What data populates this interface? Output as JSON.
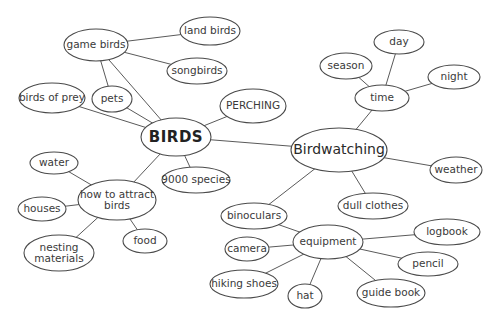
{
  "diagram": {
    "type": "mind-map",
    "nodes": [
      {
        "id": "birds",
        "label": "BIRDS",
        "x": 176,
        "y": 137,
        "rx": 35,
        "ry": 19,
        "style": "central"
      },
      {
        "id": "birdwatching",
        "label": "Birdwatching",
        "x": 339,
        "y": 150,
        "rx": 48,
        "ry": 22,
        "style": "hub"
      },
      {
        "id": "game_birds",
        "label": "game birds",
        "x": 96,
        "y": 45,
        "rx": 32,
        "ry": 16
      },
      {
        "id": "land_birds",
        "label": "land birds",
        "x": 210,
        "y": 31,
        "rx": 30,
        "ry": 14
      },
      {
        "id": "songbirds",
        "label": "songbirds",
        "x": 197,
        "y": 71,
        "rx": 30,
        "ry": 13
      },
      {
        "id": "birds_of_prey",
        "label": "birds of prey",
        "x": 52,
        "y": 98,
        "rx": 33,
        "ry": 15
      },
      {
        "id": "pets",
        "label": "pets",
        "x": 112,
        "y": 99,
        "rx": 20,
        "ry": 13
      },
      {
        "id": "perching",
        "label": "PERCHING",
        "x": 253,
        "y": 106,
        "rx": 33,
        "ry": 17
      },
      {
        "id": "species",
        "label": "9000 species",
        "x": 196,
        "y": 180,
        "rx": 34,
        "ry": 13
      },
      {
        "id": "how_to_attract",
        "label": "how to attract|birds",
        "x": 117,
        "y": 200,
        "rx": 39,
        "ry": 20
      },
      {
        "id": "water",
        "label": "water",
        "x": 54,
        "y": 163,
        "rx": 24,
        "ry": 11
      },
      {
        "id": "houses",
        "label": "houses",
        "x": 42,
        "y": 209,
        "rx": 24,
        "ry": 12
      },
      {
        "id": "nesting",
        "label": "nesting|materials",
        "x": 59,
        "y": 253,
        "rx": 35,
        "ry": 18
      },
      {
        "id": "food",
        "label": "food",
        "x": 145,
        "y": 241,
        "rx": 22,
        "ry": 12
      },
      {
        "id": "time",
        "label": "time",
        "x": 382,
        "y": 98,
        "rx": 27,
        "ry": 13
      },
      {
        "id": "day",
        "label": "day",
        "x": 399,
        "y": 42,
        "rx": 25,
        "ry": 12
      },
      {
        "id": "season",
        "label": "season",
        "x": 346,
        "y": 66,
        "rx": 26,
        "ry": 13
      },
      {
        "id": "night",
        "label": "night",
        "x": 454,
        "y": 77,
        "rx": 26,
        "ry": 12
      },
      {
        "id": "weather",
        "label": "weather",
        "x": 456,
        "y": 170,
        "rx": 26,
        "ry": 13
      },
      {
        "id": "dull_clothes",
        "label": "dull clothes",
        "x": 373,
        "y": 206,
        "rx": 35,
        "ry": 13
      },
      {
        "id": "equipment",
        "label": "equipment",
        "x": 328,
        "y": 242,
        "rx": 35,
        "ry": 17
      },
      {
        "id": "binoculars",
        "label": "binoculars",
        "x": 254,
        "y": 216,
        "rx": 33,
        "ry": 13
      },
      {
        "id": "camera",
        "label": "camera",
        "x": 247,
        "y": 249,
        "rx": 22,
        "ry": 12
      },
      {
        "id": "hiking_shoes",
        "label": "hiking shoes",
        "x": 244,
        "y": 284,
        "rx": 34,
        "ry": 14
      },
      {
        "id": "hat",
        "label": "hat",
        "x": 305,
        "y": 296,
        "rx": 17,
        "ry": 12
      },
      {
        "id": "guide_book",
        "label": "guide book",
        "x": 391,
        "y": 293,
        "rx": 34,
        "ry": 14
      },
      {
        "id": "pencil",
        "label": "pencil",
        "x": 428,
        "y": 264,
        "rx": 30,
        "ry": 12
      },
      {
        "id": "logbook",
        "label": "logbook",
        "x": 447,
        "y": 232,
        "rx": 33,
        "ry": 13
      }
    ],
    "edges": [
      [
        "game_birds",
        "land_birds"
      ],
      [
        "game_birds",
        "songbirds"
      ],
      [
        "game_birds",
        "pets"
      ],
      [
        "game_birds",
        "birds"
      ],
      [
        "pets",
        "birds"
      ],
      [
        "birds_of_prey",
        "birds"
      ],
      [
        "birds",
        "perching"
      ],
      [
        "birds",
        "species"
      ],
      [
        "birds",
        "how_to_attract"
      ],
      [
        "birds",
        "birdwatching"
      ],
      [
        "how_to_attract",
        "water"
      ],
      [
        "how_to_attract",
        "houses"
      ],
      [
        "how_to_attract",
        "nesting"
      ],
      [
        "how_to_attract",
        "food"
      ],
      [
        "birdwatching",
        "time"
      ],
      [
        "time",
        "day"
      ],
      [
        "time",
        "season"
      ],
      [
        "time",
        "night"
      ],
      [
        "birdwatching",
        "weather"
      ],
      [
        "birdwatching",
        "dull_clothes"
      ],
      [
        "birdwatching",
        "binoculars"
      ],
      [
        "equipment",
        "binoculars"
      ],
      [
        "equipment",
        "camera"
      ],
      [
        "equipment",
        "hiking_shoes"
      ],
      [
        "equipment",
        "hat"
      ],
      [
        "equipment",
        "guide_book"
      ],
      [
        "equipment",
        "pencil"
      ],
      [
        "equipment",
        "logbook"
      ]
    ]
  }
}
